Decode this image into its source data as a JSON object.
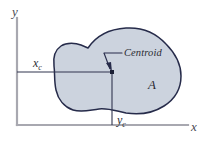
{
  "figure": {
    "type": "centroid-of-an-area-diagram",
    "background_color": "#ffffff"
  },
  "axes": {
    "x_axis_label": "x",
    "y_axis_label": "y",
    "axis_color": "#9a9aa2",
    "origin": {
      "x": 17,
      "y": 125
    },
    "y_axis_top": 18,
    "x_axis_right": 188
  },
  "region": {
    "area_label": "A",
    "fill_color": "#ccd3de",
    "outline_color": "#262b4a"
  },
  "centroid": {
    "callout_label": "Centroid",
    "marker_color": "#1b1f35",
    "point": {
      "x": 112,
      "y": 72
    },
    "leader_color": "#262b4a"
  },
  "coordinates": {
    "x_coordinate_label": "x",
    "x_coordinate_subscript": "c",
    "y_coordinate_label": "y",
    "y_coordinate_subscript": "c",
    "dimension_line_color": "#30354f"
  }
}
